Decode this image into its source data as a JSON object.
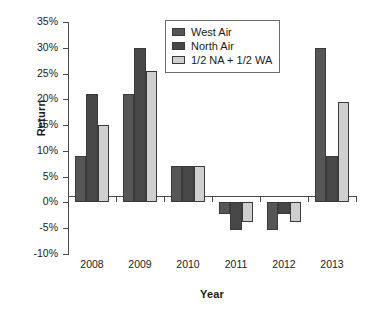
{
  "chart_data": {
    "type": "bar",
    "title": "",
    "xlabel": "Year",
    "ylabel": "Return",
    "categories": [
      "2008",
      "2009",
      "2010",
      "2011",
      "2012",
      "2013"
    ],
    "series": [
      {
        "name": "West Air",
        "color": "#565656",
        "values": [
          9,
          21,
          7,
          -2.3,
          -5.3,
          30
        ]
      },
      {
        "name": "North Air",
        "color": "#484848",
        "values": [
          21,
          30,
          7,
          -5.3,
          -2.3,
          9
        ]
      },
      {
        "name": "1/2 NA + 1/2 WA",
        "color": "#cfcfcf",
        "values": [
          15,
          25.5,
          7,
          -3.8,
          -3.8,
          19.5
        ]
      }
    ],
    "ylim": [
      -10,
      35
    ],
    "ytick_step": 5,
    "ytick_labels": [
      "35%",
      "30%",
      "25%",
      "20%",
      "15%",
      "10%",
      "5%",
      "0%",
      "-5%",
      "-10%"
    ],
    "ytick_values": [
      35,
      30,
      25,
      20,
      15,
      10,
      5,
      0,
      -5,
      -10
    ],
    "grid": false,
    "legend_position": "upper-center"
  },
  "legend": {
    "entries": [
      {
        "label": "West Air"
      },
      {
        "label": "North Air"
      },
      {
        "label": "1/2 NA + 1/2 WA"
      }
    ]
  }
}
